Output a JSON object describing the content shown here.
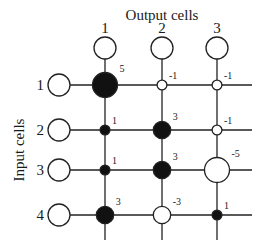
{
  "title_output": "Output cells",
  "title_input": "Input cells",
  "output_cells": [
    "1",
    "2",
    "3"
  ],
  "input_cells": [
    "1",
    "2",
    "3",
    "4"
  ],
  "weights": [
    [
      5,
      -1,
      -1
    ],
    [
      1,
      3,
      -1
    ],
    [
      1,
      3,
      -5
    ],
    [
      3,
      -3,
      1
    ]
  ],
  "weight_labels": [
    [
      "5",
      "-1",
      "-1"
    ],
    [
      "1",
      "3",
      "-1"
    ],
    [
      "1",
      "3",
      "-5"
    ],
    [
      "3",
      "-3",
      "1"
    ]
  ],
  "colors": {
    "positive": "#111111",
    "negative": "#ffffff",
    "stroke": "#222222"
  }
}
